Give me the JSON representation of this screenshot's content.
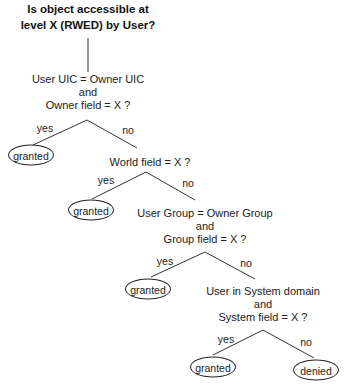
{
  "diagram": {
    "type": "decision-tree",
    "heading": {
      "line1": "Is object accessible at",
      "line2": "level X (RWED) by User?"
    },
    "nodes": [
      {
        "id": "q1",
        "lines": [
          "User UIC = Owner UIC",
          "and",
          "Owner field = X ?"
        ],
        "yes": "granted",
        "no": "q2"
      },
      {
        "id": "q2",
        "lines": [
          "World field = X ?"
        ],
        "yes": "granted",
        "no": "q3"
      },
      {
        "id": "q3",
        "lines": [
          "User Group = Owner Group",
          "and",
          "Group field = X ?"
        ],
        "yes": "granted",
        "no": "q4"
      },
      {
        "id": "q4",
        "lines": [
          "User in System domain",
          "and",
          "System field = X ?"
        ],
        "yes": "granted",
        "no": "denied"
      }
    ],
    "branch_labels": {
      "yes": "yes",
      "no": "no"
    },
    "outcomes": {
      "granted": "granted",
      "denied": "denied"
    }
  }
}
